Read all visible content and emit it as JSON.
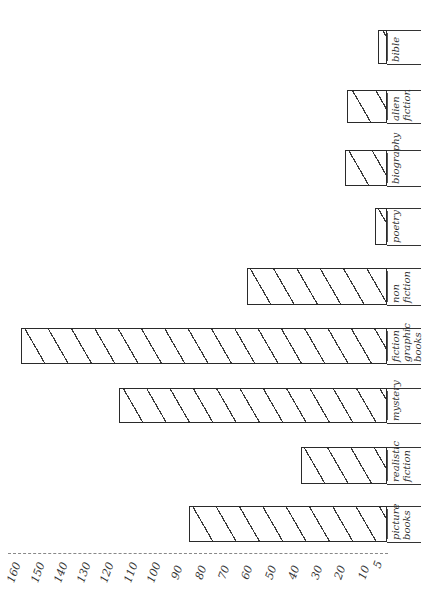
{
  "chart_data": {
    "type": "bar",
    "orientation": "horizontal (page rotated 90°, bars grow leftward from right baseline)",
    "title": "",
    "xlabel": "",
    "ylabel": "",
    "categories": [
      "picture books",
      "realistic fiction",
      "mystery",
      "fiction graphic books",
      "non fiction",
      "poetry",
      "biography",
      "alien fiction",
      "bible"
    ],
    "values": [
      85,
      37,
      115,
      157,
      60,
      5,
      18,
      17,
      4
    ],
    "value_axis_ticks": [
      160,
      150,
      140,
      130,
      120,
      110,
      100,
      90,
      80,
      70,
      60,
      50,
      40,
      30,
      20,
      10,
      5
    ],
    "value_axis_range": [
      0,
      165
    ],
    "grid": false,
    "legend": null,
    "style": "hand-drawn, diagonal hatching"
  },
  "layout": {
    "baseline_x": 387,
    "px_per_unit": 2.33,
    "bars_y": [
      [
        506,
        542
      ],
      [
        447,
        484
      ],
      [
        388,
        423
      ],
      [
        328,
        364
      ],
      [
        268,
        305
      ],
      [
        208,
        245
      ],
      [
        150,
        186
      ],
      [
        90,
        123
      ],
      [
        30,
        64
      ]
    ],
    "label_lines": [
      [
        "picture",
        "books"
      ],
      [
        "realistic",
        "fiction"
      ],
      [
        "mystery"
      ],
      [
        "fiction",
        "graphic",
        "books"
      ],
      [
        "non",
        "fiction"
      ],
      [
        "poetry"
      ],
      [
        "biography"
      ],
      [
        "alien",
        "fiction"
      ],
      [
        "bible"
      ]
    ]
  }
}
